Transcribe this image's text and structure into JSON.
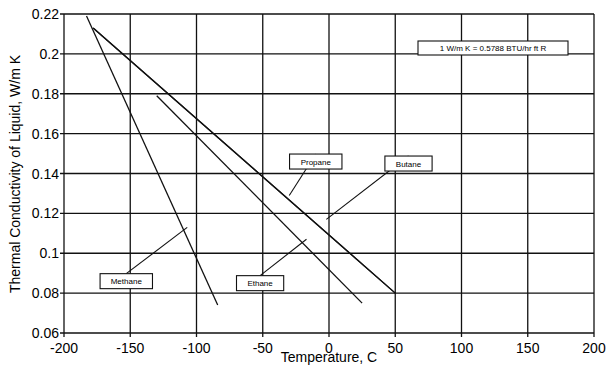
{
  "chart_data": {
    "type": "line",
    "title": "",
    "xlabel": "Temperature, C",
    "ylabel": "Thermal Conductivity of Liquid, W/m K",
    "xlim": [
      -200,
      200
    ],
    "ylim": [
      0.06,
      0.22
    ],
    "grid": true,
    "x_ticks": [
      "-200",
      "-150",
      "-100",
      "-50",
      "0",
      "50",
      "100",
      "150",
      "200"
    ],
    "y_ticks": [
      "0.06",
      "0.08",
      "0.1",
      "0.12",
      "0.14",
      "0.16",
      "0.18",
      "0.2",
      "0.22"
    ],
    "annotation": "1 W/m K = 0.5788 BTU/hr ft R",
    "series": [
      {
        "name": "Methane",
        "x": [
          -183,
          -84
        ],
        "y": [
          0.219,
          0.074
        ],
        "label_box": {
          "x": -153,
          "y": 0.086
        },
        "leader_to": {
          "x": -107,
          "y": 0.113
        }
      },
      {
        "name": "Ethane",
        "x": [
          -130,
          25
        ],
        "y": [
          0.179,
          0.075
        ],
        "label_box": {
          "x": -52,
          "y": 0.085
        },
        "leader_to": {
          "x": -17,
          "y": 0.107
        }
      },
      {
        "name": "Propane",
        "x": [
          -178,
          50
        ],
        "y": [
          0.213,
          0.08
        ],
        "label_box": {
          "x": -10,
          "y": 0.146
        },
        "leader_to": {
          "x": -30,
          "y": 0.129
        }
      },
      {
        "name": "Butane",
        "x": [
          -178,
          50
        ],
        "y": [
          0.213,
          0.08
        ],
        "label_box": {
          "x": 60,
          "y": 0.145
        },
        "leader_to": {
          "x": -2,
          "y": 0.117
        }
      }
    ]
  }
}
